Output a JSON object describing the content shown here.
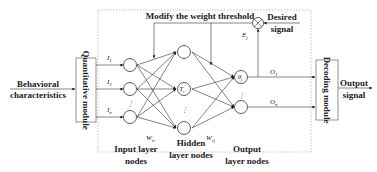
{
  "diagram": {
    "inputs": {
      "behavioral": [
        "Behavioral",
        "characteristics"
      ],
      "quantitative_module": "Quantitative module",
      "decoding_module": "Decoding module",
      "output_signal": [
        "Output",
        "signal"
      ]
    },
    "feedback": {
      "modify_label": "Modify the weight threshold",
      "desired_signal": [
        "Desired",
        "signal"
      ],
      "error_label": "E",
      "error_sub": "j"
    },
    "input_labels": [
      {
        "main": "I",
        "sub": "1"
      },
      {
        "main": "I",
        "sub": "2"
      },
      {
        "main": "I",
        "sub": "n"
      }
    ],
    "hidden_label": {
      "main": "T",
      "sub": "r"
    },
    "output_node_label": {
      "main": "θ",
      "sub": "j"
    },
    "output_labels": [
      {
        "main": "O",
        "sub": "1"
      },
      {
        "main": "O",
        "sub": "n"
      }
    ],
    "weights": {
      "w_ir": {
        "main": "W",
        "sub": "ir"
      },
      "w_rj": {
        "main": "W",
        "sub": "rj"
      }
    },
    "layer_labels": {
      "input": [
        "Input layer",
        "nodes"
      ],
      "hidden": [
        "Hidden",
        "layer nodes"
      ],
      "output": [
        "Output",
        "layer nodes"
      ]
    }
  }
}
